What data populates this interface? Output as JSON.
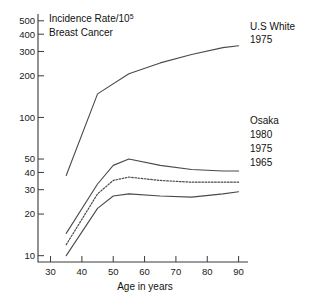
{
  "chart_data": {
    "type": "line",
    "title": "Incidence Rate/10",
    "title_superscript": "5",
    "subtitle": "Breast Cancer",
    "xlabel": "Age in years",
    "ylabel": "",
    "yscale": "log",
    "ylim": [
      9,
      560
    ],
    "xlim": [
      26,
      93
    ],
    "grid": false,
    "legend_position": "right-inline",
    "yticks": [
      10,
      20,
      30,
      40,
      50,
      100,
      200,
      300,
      400,
      500
    ],
    "ytick_labels": [
      "10",
      "20",
      "30",
      "40",
      "50",
      "100",
      "200",
      "300",
      "400",
      "500"
    ],
    "xticks": [
      30,
      40,
      50,
      60,
      70,
      80,
      90
    ],
    "xtick_labels": [
      "30",
      "40",
      "50",
      "60",
      "70",
      "80",
      "90"
    ],
    "series": [
      {
        "name": "U.S White 1975",
        "label_line1": "U.S White",
        "label_line2": "1975",
        "style": "solid",
        "x": [
          35,
          45,
          55,
          65,
          75,
          85,
          90
        ],
        "values": [
          38,
          148,
          207,
          248,
          285,
          320,
          330
        ]
      },
      {
        "name": "Osaka 1980",
        "label_line1": "Osaka",
        "label_line2": "1980",
        "style": "solid",
        "x": [
          35,
          45,
          50,
          55,
          65,
          75,
          85,
          90
        ],
        "values": [
          14.5,
          33,
          45,
          50,
          45,
          42,
          41,
          41
        ]
      },
      {
        "name": "Osaka 1975",
        "label_line1": "",
        "label_line2": "1975",
        "style": "dotted",
        "x": [
          35,
          45,
          50,
          55,
          65,
          75,
          85,
          90
        ],
        "values": [
          12,
          28,
          35,
          37,
          35,
          34,
          34,
          34
        ]
      },
      {
        "name": "Osaka 1965",
        "label_line1": "",
        "label_line2": "1965",
        "style": "solid",
        "x": [
          35,
          45,
          50,
          55,
          65,
          75,
          85,
          90
        ],
        "values": [
          10,
          22,
          27,
          28,
          27,
          26.5,
          28,
          29
        ]
      }
    ]
  },
  "annotations": {
    "us_white_label_1": "U.S White",
    "us_white_label_2": "1975",
    "osaka_label": "Osaka",
    "osaka_1980": "1980",
    "osaka_1975": "1975",
    "osaka_1965": "1965"
  },
  "colors": {
    "ink": "#1a1a1a",
    "line": "#4a4a4a",
    "background": "#ffffff"
  }
}
